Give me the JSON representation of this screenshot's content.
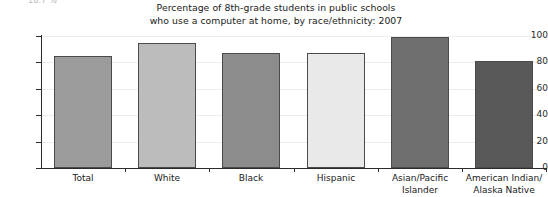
{
  "page": {
    "cutoff_text": "18.7 %"
  },
  "chart_data": {
    "type": "bar",
    "title": "Percentage of 8th-grade students in public schools who use a computer at home, by race/ethnicity: 2007",
    "title_line1": "Percentage of 8th-grade students in public schools",
    "title_line2": "who use a computer at home, by race/ethnicity: 2007",
    "subtitle": "",
    "xlabel": "",
    "ylabel": "",
    "ylim": [
      0,
      100
    ],
    "ytick_labels": [
      "100",
      "80",
      "60",
      "40",
      "20",
      "0"
    ],
    "ytick_values": [
      100,
      80,
      60,
      40,
      20,
      0
    ],
    "grid": true,
    "legend": "none",
    "categories": [
      "Total",
      "White",
      "Black",
      "Hispanic",
      "Asian/Pacific Islander",
      "American Indian/ Alaska Native"
    ],
    "category_lines": [
      [
        "Total"
      ],
      [
        "White"
      ],
      [
        "Black"
      ],
      [
        "Hispanic"
      ],
      [
        "Asian/Pacific",
        "Islander"
      ],
      [
        "American Indian/",
        "Alaska Native"
      ]
    ],
    "values": [
      85,
      95,
      87,
      87,
      99,
      81
    ],
    "bar_colors": [
      "#9b9b9b",
      "#bcbcbc",
      "#8c8c8c",
      "#e9e9e9",
      "#6e6e6e",
      "#595959"
    ],
    "bar_edge_color": "#4a4a4a",
    "grid_color": "#ededed",
    "axis_color": "#2b2b2b"
  }
}
